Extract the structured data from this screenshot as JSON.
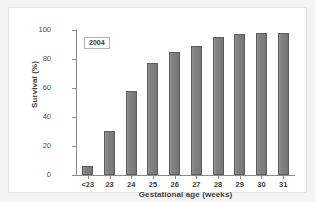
{
  "chart_data": {
    "type": "bar",
    "title": "",
    "subtitle": "",
    "xlabel": "Gestational age (weeks)",
    "ylabel": "Survival (%)",
    "categories": [
      "<23",
      "23",
      "24",
      "25",
      "26",
      "27",
      "28",
      "29",
      "30",
      "31"
    ],
    "values": [
      6,
      30.5,
      58,
      77,
      85,
      89,
      95,
      97,
      98,
      98
    ],
    "series": [
      {
        "name": "2004",
        "values": [
          6,
          30.5,
          58,
          77,
          85,
          89,
          95,
          97,
          98,
          98
        ]
      }
    ],
    "ylim": [
      0,
      100
    ],
    "yticks": [
      0,
      20,
      40,
      60,
      80,
      100
    ],
    "ytick_labels": [
      "0",
      "20",
      "40",
      "60",
      "80",
      "100"
    ],
    "grid": false,
    "legend": null,
    "annotations": [
      {
        "text": "2004",
        "position": "top-left-inside-plot",
        "boxed": true
      }
    ],
    "bar_color": "#7e7e7e",
    "bar_edge_color": "#5d5d5d",
    "axis_color": "#8c8c8c",
    "plot_background": "#ffffff",
    "figure_background": "#f4f4f4"
  }
}
